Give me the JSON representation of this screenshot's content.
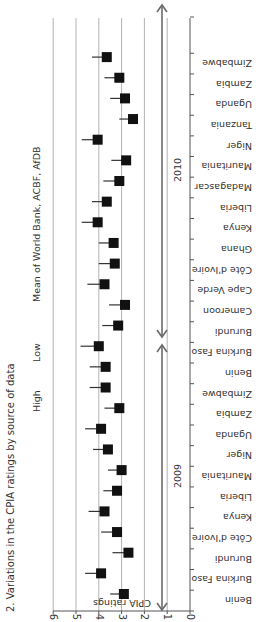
{
  "title": "2. Variations in the CPIA ratings by source of data",
  "legend": {
    "high": "High",
    "low": "Low",
    "mean": "Mean of World Bank, ACBF, AfDB"
  },
  "years": [
    {
      "label": "2009"
    },
    {
      "label": "2010"
    }
  ],
  "axis": {
    "ylabel": "CPIA ratings",
    "ticks": [
      "0",
      "1",
      "2",
      "3",
      "4",
      "5",
      "6"
    ]
  },
  "colors": {
    "marker": "#111111",
    "grid": "#b3b3b3",
    "arrow": "#6b6b6b"
  },
  "chart_data": {
    "type": "scatter",
    "title": "Variations in the CPIA ratings by source of data",
    "xlabel": "",
    "ylabel": "CPIA ratings",
    "ylim": [
      0,
      6
    ],
    "grid": true,
    "orientation": "rotated 90 degrees clockwise",
    "legend": [
      "High",
      "Low",
      "Mean of World Bank, ACBF, AfDB"
    ],
    "groups": [
      {
        "year": "2009",
        "categories": [
          "Benin",
          "Burkina Faso",
          "Burundi",
          "Côte d'Ivoire",
          "Kenya",
          "Liberia",
          "Mauritania",
          "Niger",
          "Uganda",
          "Zambia",
          "Zimbabwe"
        ],
        "mean": [
          2.9,
          3.9,
          2.7,
          3.2,
          3.75,
          3.2,
          3.0,
          3.6,
          3.9,
          3.1,
          3.7
        ],
        "high": [
          3.5,
          4.6,
          3.4,
          3.9,
          4.45,
          3.8,
          3.6,
          4.25,
          4.6,
          3.75,
          4.4
        ]
      },
      {
        "year": "2010",
        "categories": [
          "Benin",
          "Burkina Faso",
          "Burundi",
          "Cameroon",
          "Cape Verde",
          "Côte d'Ivoire",
          "Ghana",
          "Kenya",
          "Liberia",
          "Madagascar",
          "Mauritania",
          "Niger",
          "Tanzania",
          "Uganda",
          "Zambia",
          "Zimbabwe"
        ],
        "mean": [
          3.7,
          4.0,
          3.15,
          2.85,
          3.75,
          3.3,
          3.35,
          4.05,
          3.65,
          3.1,
          2.8,
          4.05,
          2.5,
          2.85,
          3.1,
          3.65
        ],
        "high": [
          4.4,
          4.8,
          3.85,
          3.55,
          4.5,
          4.0,
          4.0,
          4.75,
          4.3,
          3.8,
          3.45,
          4.75,
          3.1,
          3.5,
          3.75,
          4.3
        ]
      }
    ]
  }
}
